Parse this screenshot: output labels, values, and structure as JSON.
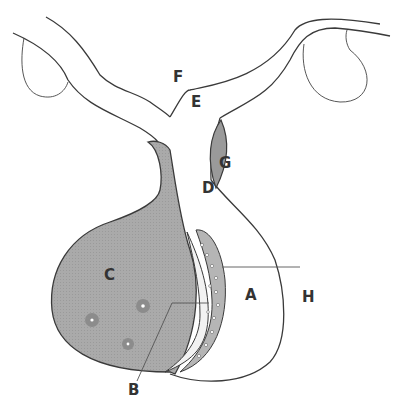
{
  "diagram": {
    "type": "anatomical-schematic",
    "colors": {
      "outline": "#3a3a3a",
      "shaded_fill": "#a8a8a8",
      "gland_fill": "#9a9a9a",
      "cell_spot": "#8c8c8c",
      "background": "#ffffff"
    },
    "labels": [
      {
        "id": "A",
        "text": "A",
        "x": 245,
        "y": 288
      },
      {
        "id": "B",
        "text": "B",
        "x": 128,
        "y": 383
      },
      {
        "id": "C",
        "text": "C",
        "x": 104,
        "y": 268
      },
      {
        "id": "D",
        "text": "D",
        "x": 202,
        "y": 181
      },
      {
        "id": "E",
        "text": "E",
        "x": 191,
        "y": 95
      },
      {
        "id": "F",
        "text": "F",
        "x": 173,
        "y": 70
      },
      {
        "id": "G",
        "text": "G",
        "x": 219,
        "y": 156
      },
      {
        "id": "H",
        "text": "H",
        "x": 302,
        "y": 290
      }
    ],
    "leader_lines": [
      {
        "label": "H",
        "from": [
          300,
          267
        ],
        "to": [
          222,
          267
        ]
      },
      {
        "label": "B",
        "from": [
          137,
          381
        ],
        "to": [
          172,
          303
        ],
        "elbow": [
          209,
          303
        ]
      }
    ]
  }
}
